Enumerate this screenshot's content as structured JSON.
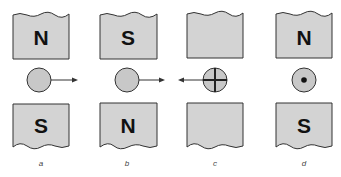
{
  "panels": [
    {
      "label": "a",
      "top_pole": "N",
      "bottom_pole": "S",
      "conductor": "plain",
      "force": "right"
    },
    {
      "label": "b",
      "top_pole": "S",
      "bottom_pole": "N",
      "conductor": "plain",
      "force": "right"
    },
    {
      "label": "c",
      "top_pole": "",
      "bottom_pole": "",
      "conductor": "cross",
      "force": "left"
    },
    {
      "label": "d",
      "top_pole": "N",
      "bottom_pole": "S",
      "conductor": "dot",
      "force": "none"
    }
  ],
  "colors": {
    "magnet": "#d3d3d3",
    "conductor": "#c8c8c8",
    "stroke": "#333333"
  }
}
